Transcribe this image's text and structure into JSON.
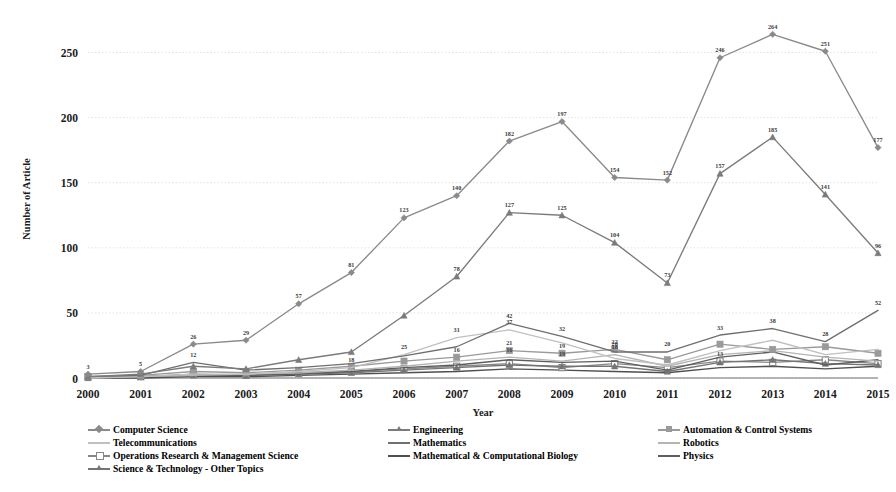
{
  "chart_data": {
    "type": "line",
    "title": "",
    "xlabel": "Year",
    "ylabel": "Number of Article",
    "grid": true,
    "legend_position": "bottom",
    "ylim": [
      0,
      275
    ],
    "yticks": [
      0,
      50,
      100,
      150,
      200,
      250
    ],
    "categories": [
      "2000",
      "2001",
      "2002",
      "2003",
      "2004",
      "2005",
      "2006",
      "2007",
      "2008",
      "2009",
      "2010",
      "2011",
      "2012",
      "2013",
      "2014",
      "2015"
    ],
    "series": [
      {
        "name": "Computer Science",
        "color": "#8a8a8a",
        "marker": "diamond",
        "values": [
          3,
          5,
          26,
          29,
          57,
          81,
          123,
          140,
          182,
          197,
          154,
          152,
          246,
          264,
          251,
          177
        ],
        "labels": [
          "3",
          "5",
          "26",
          "29",
          "57",
          "81",
          "123",
          "140",
          "182",
          "197",
          "154",
          "152",
          "246",
          "264",
          "251",
          "177"
        ]
      },
      {
        "name": "Engineering",
        "color": "#7b7b7b",
        "marker": "triangle",
        "values": [
          1,
          3,
          9,
          7,
          14,
          20,
          48,
          78,
          127,
          125,
          104,
          73,
          157,
          185,
          141,
          96
        ],
        "labels": [
          "",
          "",
          "",
          "",
          "",
          "",
          "",
          "78",
          "127",
          "125",
          "104",
          "73",
          "157",
          "185",
          "141",
          "96"
        ]
      },
      {
        "name": "Automation & Control Systems",
        "color": "#9a9a9a",
        "marker": "square",
        "values": [
          1,
          2,
          5,
          4,
          6,
          9,
          13,
          16,
          21,
          19,
          22,
          14,
          26,
          22,
          24,
          19
        ],
        "labels": [
          "",
          "",
          "",
          "",
          "",
          "",
          "",
          "16",
          "21",
          "19",
          "22",
          "",
          "",
          "",
          "",
          ""
        ]
      },
      {
        "name": "Telecommunications",
        "color": "#c0c0c0",
        "marker": "none",
        "values": [
          0,
          1,
          3,
          3,
          5,
          8,
          18,
          31,
          37,
          27,
          15,
          10,
          21,
          29,
          18,
          22
        ],
        "labels": [
          "",
          "",
          "",
          "",
          "",
          "18",
          "25",
          "31",
          "37",
          "",
          "",
          "",
          "",
          "",
          "",
          ""
        ]
      },
      {
        "name": "Mathematics",
        "color": "#6f6f6f",
        "marker": "none",
        "values": [
          1,
          2,
          12,
          6,
          8,
          11,
          17,
          24,
          42,
          32,
          20,
          20,
          33,
          38,
          28,
          52
        ],
        "labels": [
          "",
          "",
          "12",
          "",
          "",
          "",
          "",
          "",
          "42",
          "32",
          "20",
          "20",
          "33",
          "38",
          "28",
          "52"
        ]
      },
      {
        "name": "Robotics",
        "color": "#b4b4b4",
        "marker": "none",
        "values": [
          0,
          1,
          2,
          3,
          4,
          6,
          9,
          13,
          16,
          13,
          18,
          9,
          18,
          21,
          16,
          13
        ],
        "labels": [
          "",
          "",
          "",
          "",
          "",
          "",
          "",
          "",
          "16",
          "19",
          "18",
          "",
          "",
          "",
          "",
          ""
        ]
      },
      {
        "name": "Operations Research & Management Science",
        "color": "#868686",
        "marker": "square-open",
        "values": [
          1,
          1,
          3,
          2,
          4,
          5,
          7,
          9,
          11,
          8,
          11,
          8,
          13,
          12,
          14,
          11
        ],
        "labels": [
          "",
          "",
          "",
          "",
          "",
          "",
          "",
          "",
          "",
          "",
          "",
          "",
          "13",
          "",
          "",
          ""
        ]
      },
      {
        "name": "Mathematical & Computational Biology",
        "color": "#4f4f4f",
        "marker": "none",
        "values": [
          0,
          0,
          1,
          1,
          2,
          3,
          4,
          5,
          7,
          6,
          5,
          4,
          8,
          9,
          7,
          9
        ],
        "labels": [
          "",
          "",
          "",
          "",
          "",
          "",
          "",
          "",
          "",
          "",
          "",
          "",
          "",
          "",
          "",
          ""
        ]
      },
      {
        "name": "Physics",
        "color": "#5e5e5e",
        "marker": "none",
        "values": [
          0,
          1,
          2,
          2,
          3,
          5,
          8,
          10,
          14,
          12,
          13,
          6,
          16,
          20,
          10,
          14
        ],
        "labels": [
          "",
          "",
          "",
          "",
          "",
          "",
          "",
          "",
          "",
          "",
          "",
          "",
          "",
          "",
          "",
          ""
        ]
      },
      {
        "name": "Science & Technology - Other Topics",
        "color": "#747474",
        "marker": "triangle",
        "values": [
          0,
          1,
          2,
          2,
          3,
          4,
          6,
          8,
          10,
          9,
          9,
          5,
          12,
          14,
          11,
          10
        ],
        "labels": [
          "",
          "",
          "",
          "",
          "",
          "",
          "",
          "",
          "",
          "",
          "",
          "",
          "",
          "",
          "",
          ""
        ]
      }
    ]
  },
  "legend": {
    "columns": [
      [
        {
          "label": "Computer Science",
          "color": "#8a8a8a",
          "marker": "diamond"
        },
        {
          "label": "Telecommunications",
          "color": "#c0c0c0",
          "marker": "none"
        },
        {
          "label": "Operations Research & Management Science",
          "color": "#868686",
          "marker": "square-open"
        },
        {
          "label": "Science & Technology - Other Topics",
          "color": "#747474",
          "marker": "triangle"
        }
      ],
      [
        {
          "label": "Engineering",
          "color": "#7b7b7b",
          "marker": "triangle"
        },
        {
          "label": "Mathematics",
          "color": "#6f6f6f",
          "marker": "none"
        },
        {
          "label": "Mathematical & Computational Biology",
          "color": "#4f4f4f",
          "marker": "none"
        }
      ],
      [
        {
          "label": "Automation & Control Systems",
          "color": "#9a9a9a",
          "marker": "square"
        },
        {
          "label": "Robotics",
          "color": "#b4b4b4",
          "marker": "none"
        },
        {
          "label": "Physics",
          "color": "#5e5e5e",
          "marker": "none"
        }
      ]
    ]
  }
}
